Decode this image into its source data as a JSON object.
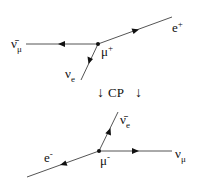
{
  "diagram": {
    "line_color": "#555555",
    "text_color": "#111111",
    "top": {
      "vertex_label": "μ",
      "vertex_sup": "+",
      "left_label": "ν̄",
      "left_sub": "μ",
      "right_label": "e",
      "right_sup": "+",
      "lower_label": "ν",
      "lower_sub": "e"
    },
    "transform": {
      "arrow_left": "↓",
      "label": "CP",
      "arrow_right": "↓"
    },
    "bottom": {
      "vertex_label": "μ",
      "vertex_sup": "-",
      "upper_label": "ν̄",
      "upper_sub": "e",
      "left_label": "e",
      "left_sup": "-",
      "right_label": "ν",
      "right_sub": "μ"
    }
  }
}
